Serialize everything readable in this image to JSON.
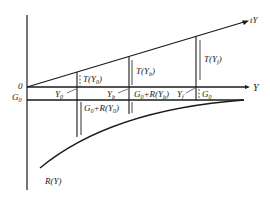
{
  "diagram": {
    "type": "economics-tax-revenue-diagram",
    "axes": {
      "horizontal_label": "Y",
      "origin_label": "0",
      "g0_label": "G",
      "g0_sub": "0"
    },
    "curves": {
      "tax_line_label": "tY",
      "revenue_curve_label": "R(Y)"
    },
    "points": [
      {
        "name": "Y",
        "sub": "0",
        "tax_label": "T(Y",
        "tax_sub": "0",
        "gap_label": "G",
        "gap_sub": "0",
        "gap_rest": "+R(Y",
        "gap_rest_sub": "0"
      },
      {
        "name": "Y",
        "sub": "b",
        "tax_label": "T(Y",
        "tax_sub": "b",
        "gap_label": "G",
        "gap_sub": "0",
        "gap_rest": "+R(Y",
        "gap_rest_sub": "b"
      },
      {
        "name": "Y",
        "sub": "f",
        "tax_label": "T(Y",
        "tax_sub": "f",
        "gap_label": "G",
        "gap_sub": "0"
      }
    ],
    "close_paren": ")",
    "colors": {
      "line": "#1a1a1a",
      "background": "#ffffff"
    }
  }
}
